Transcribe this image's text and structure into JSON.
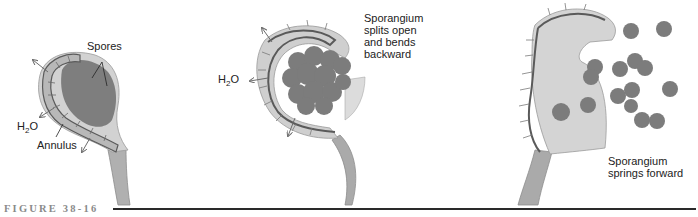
{
  "figure": {
    "caption": "FIGURE 38-16",
    "palette": {
      "background": "#ffffff",
      "sporangium_wall": "#c9c9c9",
      "annulus_cells": "#b4b4b4",
      "annulus_line": "#5a5a5a",
      "spores": "#7a7a7a",
      "stalk": "#a9a9a9",
      "arrow": "#6c6c6c",
      "text": "#222222",
      "caption": "#8a8a8a"
    },
    "panels": [
      {
        "id": "panel-1",
        "labels": {
          "spores": "Spores",
          "h2o_prefix": "H",
          "h2o_sub": "2",
          "h2o_suffix": "O",
          "annulus": "Annulus"
        }
      },
      {
        "id": "panel-2",
        "labels": {
          "h2o_prefix": "H",
          "h2o_sub": "2",
          "h2o_suffix": "O",
          "description": "Sporangium\nsplits open\nand bends\nbackward"
        }
      },
      {
        "id": "panel-3",
        "labels": {
          "description": "Sporangium\nsprings forward"
        }
      }
    ]
  }
}
